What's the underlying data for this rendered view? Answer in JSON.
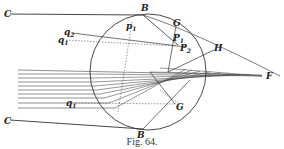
{
  "figure": {
    "caption": "Fig. 64.",
    "labels": {
      "C_top": "C",
      "B_top": "B",
      "p1": "p",
      "p1_sub": "1",
      "G_top": "G",
      "q2": "q",
      "q2_sub": "2",
      "q1": "q",
      "q1_sub": "1",
      "P1": "P",
      "P1_sub": "1",
      "P2": "P",
      "P2_sub": "2",
      "H": "H",
      "F": "F",
      "q1_low": "q",
      "q1_low_sub": "1",
      "G_low": "G",
      "B_low": "B",
      "C_low": "C"
    },
    "colors": {
      "ink": "#222222",
      "background": "#ffffff"
    }
  }
}
